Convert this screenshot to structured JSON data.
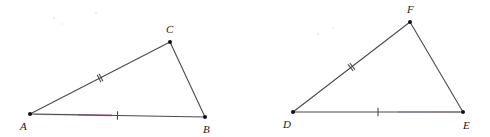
{
  "figure": {
    "background_color": "#ffffff",
    "stroke_color": "#4a4a52",
    "label_color": "#1a1a1a",
    "vertex_color": "#111118"
  },
  "triangles": [
    {
      "id": "triangle-abc",
      "name": "triangle ABC",
      "vertices": [
        {
          "key": "A",
          "label": "A",
          "x": 30,
          "y": 114,
          "label_x": 20,
          "label_y": 130
        },
        {
          "key": "B",
          "label": "B",
          "x": 205,
          "y": 117,
          "label_x": 203,
          "label_y": 133
        },
        {
          "key": "C",
          "label": "C",
          "x": 170,
          "y": 42,
          "label_x": 166,
          "label_y": 33
        }
      ],
      "edges": [
        {
          "id": "edge-ab",
          "from": "A",
          "to": "B",
          "ticks": 1
        },
        {
          "id": "edge-ac",
          "from": "A",
          "to": "C",
          "ticks": 2
        },
        {
          "id": "edge-cb",
          "from": "C",
          "to": "B",
          "ticks": 0
        }
      ],
      "tints": [
        {
          "id": "tint-ab-green",
          "color": "#97dd9a",
          "x1": 34,
          "y1": 114.2,
          "x2": 78,
          "y2": 114.9
        },
        {
          "id": "tint-ab-magenta",
          "color": "#c46ec4",
          "x1": 78,
          "y1": 114.9,
          "x2": 112,
          "y2": 115.4
        }
      ]
    },
    {
      "id": "triangle-def",
      "name": "triangle DEF",
      "vertices": [
        {
          "key": "D",
          "label": "D",
          "x": 293,
          "y": 112,
          "label_x": 283,
          "label_y": 128
        },
        {
          "key": "E",
          "label": "E",
          "x": 463,
          "y": 112,
          "label_x": 463,
          "label_y": 129
        },
        {
          "key": "F",
          "label": "F",
          "x": 410,
          "y": 22,
          "label_x": 407,
          "label_y": 13
        }
      ],
      "edges": [
        {
          "id": "edge-de",
          "from": "D",
          "to": "E",
          "ticks": 1
        },
        {
          "id": "edge-df",
          "from": "D",
          "to": "F",
          "ticks": 2
        },
        {
          "id": "edge-fe",
          "from": "F",
          "to": "E",
          "ticks": 0
        }
      ],
      "tints": [
        {
          "id": "tint-de-teal",
          "color": "#b9cfcc",
          "x1": 398,
          "y1": 112,
          "x2": 432,
          "y2": 112
        },
        {
          "id": "tint-de-warm",
          "color": "#d4bcbc",
          "x1": 432,
          "y1": 112,
          "x2": 460,
          "y2": 112
        }
      ]
    }
  ],
  "specks": [
    {
      "x": 54,
      "y": 18,
      "r": 1.1
    },
    {
      "x": 96,
      "y": 13,
      "r": 0.9
    },
    {
      "x": 62,
      "y": 24,
      "r": 0.8
    },
    {
      "x": 318,
      "y": 34,
      "r": 1.0
    },
    {
      "x": 333,
      "y": 28,
      "r": 0.8
    }
  ]
}
